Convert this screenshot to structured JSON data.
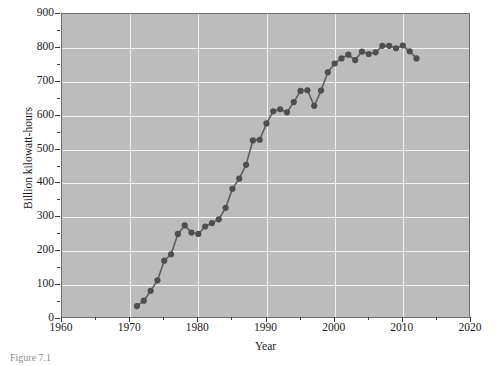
{
  "figure": {
    "caption": "Figure 7.1"
  },
  "chart_data": {
    "type": "line",
    "title": "",
    "xlabel": "Year",
    "ylabel": "Billion kilowatt-hours",
    "xlim": [
      1960,
      2020
    ],
    "ylim": [
      0,
      900
    ],
    "xticks": [
      1960,
      1970,
      1980,
      1990,
      2000,
      2010,
      2020
    ],
    "xtick_labels": [
      "1960",
      "1970",
      "1980",
      "1990",
      "2000",
      "2010",
      "2020"
    ],
    "xtick_minor_step": 5,
    "yticks": [
      0,
      100,
      200,
      300,
      400,
      500,
      600,
      700,
      800,
      900
    ],
    "ytick_labels": [
      "0",
      "100",
      "200",
      "300",
      "400",
      "500",
      "600",
      "700",
      "800",
      "900"
    ],
    "ytick_minor_step": 50,
    "grid": true,
    "legend": null,
    "style": {
      "plot_background": "#bcbcbc",
      "grid_color": "#f2f2f2",
      "line_color": "#5e5e5e",
      "marker_color": "#4f4f4f",
      "frame_color": "#6f6f6f",
      "page_background": "#ffffff"
    },
    "marker": "circle",
    "series": [
      {
        "name": "Nuclear electricity generation",
        "x": [
          1971,
          1972,
          1973,
          1974,
          1975,
          1976,
          1977,
          1978,
          1979,
          1980,
          1981,
          1982,
          1983,
          1984,
          1985,
          1986,
          1987,
          1988,
          1989,
          1990,
          1991,
          1992,
          1993,
          1994,
          1995,
          1996,
          1997,
          1998,
          1999,
          2000,
          2001,
          2002,
          2003,
          2004,
          2005,
          2006,
          2007,
          2008,
          2009,
          2010,
          2011,
          2012
        ],
        "y": [
          38,
          54,
          83,
          114,
          172,
          191,
          251,
          276,
          255,
          251,
          273,
          283,
          294,
          328,
          384,
          414,
          455,
          527,
          529,
          577,
          613,
          619,
          610,
          640,
          673,
          675,
          629,
          674,
          728,
          754,
          769,
          780,
          764,
          789,
          782,
          787,
          806,
          806,
          799,
          807,
          790,
          769
        ]
      }
    ]
  }
}
